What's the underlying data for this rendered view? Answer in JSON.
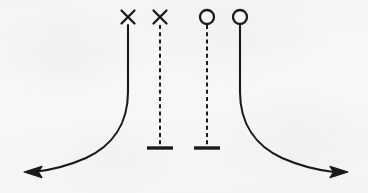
{
  "figure": {
    "kind": "hand-drawn-schematic-diagram",
    "background_color": "#f7f7f6",
    "ink_color": "#1a1a1a",
    "width": 368,
    "height": 193,
    "stroke_width_curve": 2.1,
    "stroke_width_stem": 2.0,
    "stroke_width_dashed": 2.0,
    "dash_pattern": "4,3.2",
    "branches": [
      {
        "id": "branch-1",
        "marker": "x-marker",
        "marker_x": 128,
        "marker_y": 17,
        "marker_size": 15,
        "line_style": "solid",
        "stem_top_y": 25,
        "terminator": "arrowhead",
        "direction": "left",
        "path": "M 128 25 L 128 92 C 128 124 112 146 86 158 C 70 165 52 170 34 172",
        "arrow_tip_x": 24,
        "arrow_tip_y": 172,
        "arrow_angle": 186
      },
      {
        "id": "branch-2",
        "marker": "x-marker",
        "marker_x": 160,
        "marker_y": 17,
        "marker_size": 15,
        "line_style": "dashed",
        "stem_top_y": 25,
        "terminator": "t-bar",
        "direction": "down",
        "path": "M 160 25 L 160 147",
        "tbar_y": 148,
        "tbar_width": 26,
        "tbar_thickness": 3.4
      },
      {
        "id": "branch-3",
        "marker": "circle-marker",
        "marker_x": 207,
        "marker_y": 17,
        "marker_radius": 7,
        "line_style": "dashed",
        "stem_top_y": 25,
        "terminator": "t-bar",
        "direction": "down",
        "path": "M 207 25 L 207 147",
        "tbar_y": 148,
        "tbar_width": 26,
        "tbar_thickness": 3.4
      },
      {
        "id": "branch-4",
        "marker": "circle-marker",
        "marker_x": 240,
        "marker_y": 17,
        "marker_radius": 7,
        "line_style": "solid",
        "stem_top_y": 25,
        "terminator": "arrowhead",
        "direction": "right",
        "path": "M 240 25 L 240 92 C 240 124 256 146 282 158 C 298 165 316 170 334 172",
        "arrow_tip_x": 348,
        "arrow_tip_y": 172,
        "arrow_angle": 6
      }
    ]
  }
}
